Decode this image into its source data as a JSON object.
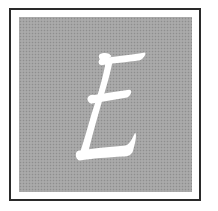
{
  "drop_cap": {
    "letter": "E",
    "style": "calligraphic white letter on halftone gray square with black frame",
    "colors": {
      "frame": "#2a2a2a",
      "field": "#a4a4a4",
      "letter": "#ffffff",
      "background": "#ffffff"
    }
  }
}
